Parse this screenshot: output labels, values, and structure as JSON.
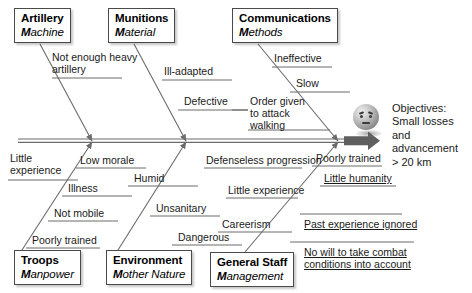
{
  "diagram": {
    "type": "fishbone-ishikawa",
    "title_visible": false,
    "spine_arrow": "rightwards-arrow"
  },
  "categories": [
    {
      "id": "artillery",
      "name": "Artillery",
      "sub_m": "M",
      "sub_rest": "achine",
      "position": "top"
    },
    {
      "id": "munitions",
      "name": "Munitions",
      "sub_m": "M",
      "sub_rest": "aterial",
      "position": "top"
    },
    {
      "id": "communications",
      "name": "Communications",
      "sub_m": "M",
      "sub_rest": "ethods",
      "position": "top"
    },
    {
      "id": "troops",
      "name": "Troops",
      "sub_m": "M",
      "sub_rest": "anpower",
      "position": "bottom"
    },
    {
      "id": "environment",
      "name": "Environment",
      "sub_m": "M",
      "sub_rest": "other Nature",
      "position": "bottom"
    },
    {
      "id": "general-staff",
      "name": "General Staff",
      "sub_m": "M",
      "sub_rest": "anagement",
      "position": "bottom"
    }
  ],
  "causes": {
    "artillery": [
      {
        "id": "not-enough-heavy-artillery",
        "line1": "Not enough heavy",
        "line2": "artillery"
      }
    ],
    "munitions": [
      {
        "id": "ill-adapted",
        "line1": "Ill-adapted"
      },
      {
        "id": "defective",
        "line1": "Defective"
      }
    ],
    "communications": [
      {
        "id": "ineffective",
        "line1": "Ineffective"
      },
      {
        "id": "slow",
        "line1": "Slow"
      },
      {
        "id": "order-given-to-attack-walking",
        "line1": "Order given",
        "line2": "to attack",
        "line3": "walking"
      }
    ],
    "troops": [
      {
        "id": "little-experience-troops",
        "line1": "Little",
        "line2": "experience"
      },
      {
        "id": "low-morale",
        "line1": "Low morale"
      },
      {
        "id": "illness",
        "line1": "Illness"
      },
      {
        "id": "not-mobile",
        "line1": "Not mobile"
      },
      {
        "id": "poorly-trained-troops",
        "line1": "Poorly trained"
      }
    ],
    "environment": [
      {
        "id": "humid",
        "line1": "Humid"
      },
      {
        "id": "unsanitary",
        "line1": "Unsanitary"
      },
      {
        "id": "dangerous",
        "line1": "Dangerous"
      }
    ],
    "general_staff": [
      {
        "id": "defenseless-progression",
        "line1": "Defenseless progression"
      },
      {
        "id": "little-experience-staff",
        "line1": "Little experience"
      },
      {
        "id": "careerism",
        "line1": "Careerism"
      },
      {
        "id": "poorly-trained-staff",
        "line1": "Poorly trained"
      },
      {
        "id": "little-humanity",
        "line1": "Little humanity"
      },
      {
        "id": "past-experience-ignored",
        "line1": "Past experience ignored"
      },
      {
        "id": "no-will-to-take-combat-conditions-into-account",
        "line1": "No will to take combat",
        "line2": "conditions into account"
      }
    ]
  },
  "objective": {
    "label": "Objectives:",
    "line2": "Small losses",
    "line3": "and",
    "line4": "advancement",
    "line5": "> 20 km",
    "icon": "sphere-face-icon"
  },
  "colors": {
    "line": "#6b6b6b",
    "box_border": "#4a4a4a",
    "text": "#1a1a1a",
    "background": "#ffffff"
  }
}
